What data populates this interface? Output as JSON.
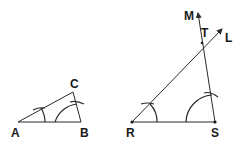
{
  "diagram": {
    "triangle_1": {
      "vertices": [
        "A",
        "B",
        "C"
      ],
      "labels": {
        "A": "A",
        "B": "B",
        "C": "C"
      }
    },
    "triangle_2": {
      "vertices": [
        "R",
        "S",
        "T"
      ],
      "labels": {
        "R": "R",
        "S": "S",
        "T": "T"
      },
      "rays": {
        "L": "L",
        "M": "M"
      }
    },
    "colors": {
      "stroke": "#2a2a2a",
      "background": "#ffffff"
    }
  }
}
